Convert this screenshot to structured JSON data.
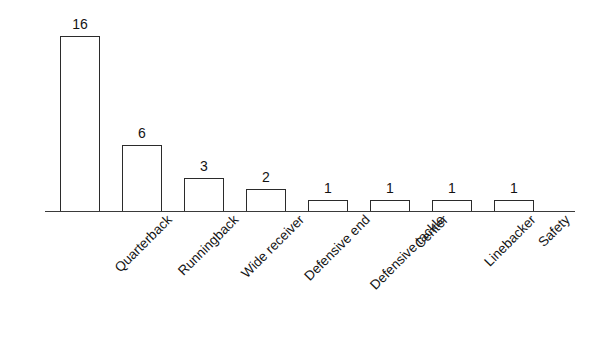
{
  "figure": {
    "clipped_title_fragment": "",
    "background_color": "#ffffff",
    "bar_outline_color": "#2b2b2b",
    "bar_fill_color": "#ffffff",
    "axis_color": "#3a3a3a",
    "label_color": "#141414"
  },
  "chart_data": {
    "type": "bar",
    "title": "",
    "xlabel": "",
    "ylabel": "",
    "orientation": "vertical",
    "grid": false,
    "legend": null,
    "y_axis_visible": false,
    "tick_marks": false,
    "data_labels_shown": true,
    "ylim": [
      0,
      16
    ],
    "categories": [
      "Quarterback",
      "Runningback",
      "Wide receiver",
      "Defensive end",
      "Defensive tackle",
      "Center",
      "Linebacker",
      "Safety"
    ],
    "values": [
      16,
      6,
      3,
      2,
      1,
      1,
      1,
      1
    ],
    "value_labels": [
      "16",
      "6",
      "3",
      "2",
      "1",
      "1",
      "1",
      "1"
    ]
  }
}
